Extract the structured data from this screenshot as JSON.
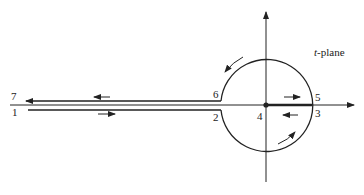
{
  "diagram": {
    "title_var": "t",
    "title_suffix": "-plane",
    "point_labels": {
      "p1": "1",
      "p2": "2",
      "p3": "3",
      "p4": "4",
      "p5": "5",
      "p6": "6",
      "p7": "7"
    },
    "stroke_color": "#222222"
  }
}
